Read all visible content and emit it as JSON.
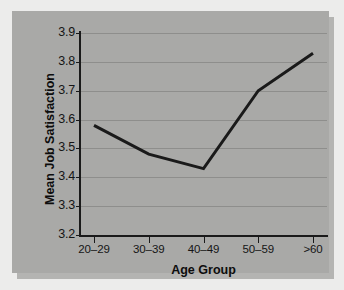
{
  "chart_data": {
    "type": "line",
    "title": "",
    "subtitle": "",
    "xlabel": "Age Group",
    "ylabel": "Mean Job Satisfaction",
    "categories": [
      "20–29",
      "30–39",
      "40–49",
      "50–59",
      ">60"
    ],
    "values": [
      3.58,
      3.48,
      3.43,
      3.7,
      3.83
    ],
    "series": [
      {
        "name": "Mean Job Satisfaction",
        "values": [
          3.58,
          3.48,
          3.43,
          3.7,
          3.83
        ]
      }
    ],
    "ylim": [
      3.2,
      3.9
    ],
    "yticks": [
      3.2,
      3.3,
      3.4,
      3.5,
      3.6,
      3.7,
      3.8,
      3.9
    ],
    "ytick_labels": [
      "3.2",
      "3.3",
      "3.4",
      "3.5",
      "3.6",
      "3.7",
      "3.8",
      "3.9"
    ],
    "grid": "horizontal",
    "legend": "none",
    "line_color": "#1a1a1a",
    "line_width": 3,
    "markers": "none",
    "panel_color": "#a9a9a7",
    "gridline_color": "#8e8e8c",
    "background_color": "#ececeb",
    "axis_color": "#1a1a1a"
  }
}
